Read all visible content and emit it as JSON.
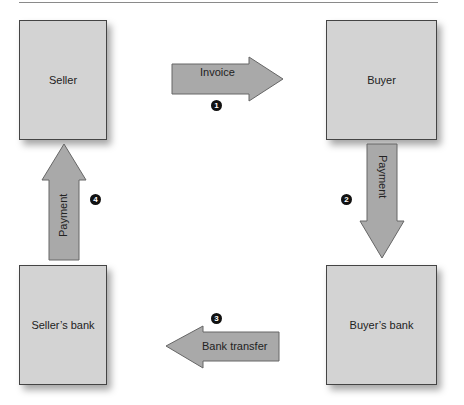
{
  "diagram": {
    "type": "payment-flow",
    "nodes": [
      {
        "id": "seller",
        "label": "Seller"
      },
      {
        "id": "buyer",
        "label": "Buyer"
      },
      {
        "id": "sellers_bank",
        "label": "Seller’s bank"
      },
      {
        "id": "buyers_bank",
        "label": "Buyer’s bank"
      }
    ],
    "edges": [
      {
        "step": "1",
        "from": "seller",
        "to": "buyer",
        "label": "Invoice"
      },
      {
        "step": "2",
        "from": "buyer",
        "to": "buyers_bank",
        "label": "Payment"
      },
      {
        "step": "3",
        "from": "buyers_bank",
        "to": "sellers_bank",
        "label": "Bank transfer"
      },
      {
        "step": "4",
        "from": "sellers_bank",
        "to": "seller",
        "label": "Payment"
      }
    ],
    "colors": {
      "box_fill": "#d3d3d3",
      "arrow_fill": "#a9a9a9",
      "border": "#444444",
      "marker": "#111111"
    }
  }
}
